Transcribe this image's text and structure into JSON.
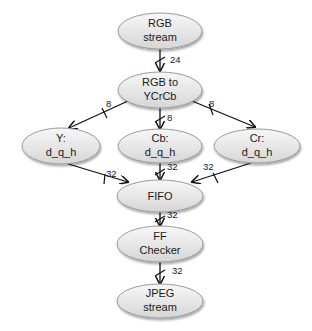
{
  "diagram": {
    "type": "flowchart",
    "nodes": [
      {
        "id": "rgb_stream",
        "line1": "RGB",
        "line2": "stream",
        "cx": 160,
        "cy": 31,
        "rx": 42,
        "ry": 18
      },
      {
        "id": "rgb_to_ycrcb",
        "line1": "RGB to",
        "line2": "YCrCb",
        "cx": 160,
        "cy": 90,
        "rx": 42,
        "ry": 18
      },
      {
        "id": "y_dqh",
        "line1": "Y:",
        "line2": "d_q_h",
        "cx": 61,
        "cy": 146,
        "rx": 39,
        "ry": 18
      },
      {
        "id": "cb_dqh",
        "line1": "Cb:",
        "line2": "d_q_h",
        "cx": 160,
        "cy": 146,
        "rx": 42,
        "ry": 17
      },
      {
        "id": "cr_dqh",
        "line1": "Cr:",
        "line2": "d_q_h",
        "cx": 257,
        "cy": 146,
        "rx": 43,
        "ry": 17
      },
      {
        "id": "fifo",
        "line1": "FIFO",
        "line2": "",
        "cx": 160,
        "cy": 196,
        "rx": 43,
        "ry": 16
      },
      {
        "id": "ff_checker",
        "line1": "FF",
        "line2": "Checker",
        "cx": 160,
        "cy": 244,
        "rx": 43,
        "ry": 18
      },
      {
        "id": "jpeg_stream",
        "line1": "JPEG",
        "line2": "stream",
        "cx": 160,
        "cy": 301,
        "rx": 43,
        "ry": 17
      }
    ],
    "edges": [
      {
        "from": "rgb_stream",
        "to": "rgb_to_ycrcb",
        "bus_width": "24"
      },
      {
        "from": "rgb_to_ycrcb",
        "to": "y_dqh",
        "bus_width": "8"
      },
      {
        "from": "rgb_to_ycrcb",
        "to": "cb_dqh",
        "bus_width": "8"
      },
      {
        "from": "rgb_to_ycrcb",
        "to": "cr_dqh",
        "bus_width": "8"
      },
      {
        "from": "y_dqh",
        "to": "fifo",
        "bus_width": "32"
      },
      {
        "from": "cb_dqh",
        "to": "fifo",
        "bus_width": "32"
      },
      {
        "from": "cr_dqh",
        "to": "fifo",
        "bus_width": "32"
      },
      {
        "from": "fifo",
        "to": "ff_checker",
        "bus_width": "32"
      },
      {
        "from": "ff_checker",
        "to": "jpeg_stream",
        "bus_width": "32"
      }
    ]
  },
  "colors": {
    "node_fill_top": "#f7f7f7",
    "node_fill_bottom": "#d6d6d6",
    "node_border": "#9a9a9a",
    "edge": "#111111",
    "text": "#1a1a1a"
  }
}
